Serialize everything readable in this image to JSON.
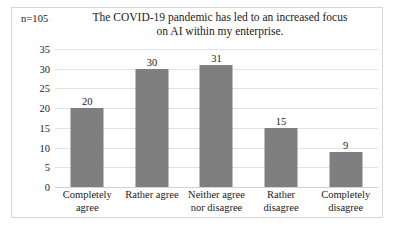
{
  "figure": {
    "sample_size_label": "n=105",
    "border_color": "#d6d6d6",
    "background": "#ffffff"
  },
  "chart_data": {
    "type": "bar",
    "title": "The COVID-19 pandemic has led to an increased focus on AI within my enterprise.",
    "title_lines": [
      "The COVID-19 pandemic has led to an increased focus",
      "on AI within my enterprise."
    ],
    "categories": [
      "Completely agree",
      "Rather agree",
      "Neither agree nor disagree",
      "Rather disagree",
      "Completely disagree"
    ],
    "category_lines": [
      [
        "Completely",
        "agree"
      ],
      [
        "Rather agree"
      ],
      [
        "Neither agree",
        "nor disagree"
      ],
      [
        "Rather disagree"
      ],
      [
        "Completely",
        "disagree"
      ]
    ],
    "values": [
      20,
      30,
      31,
      15,
      9
    ],
    "value_labels": [
      "20",
      "30",
      "31",
      "15",
      "9"
    ],
    "xlabel": "",
    "ylabel": "",
    "ylim": [
      0,
      35
    ],
    "yticks": [
      0,
      5,
      10,
      15,
      20,
      25,
      30,
      35
    ],
    "ytick_labels": [
      "0",
      "5",
      "10",
      "15",
      "20",
      "25",
      "30",
      "35"
    ],
    "grid": true,
    "legend": false,
    "bar_color": "#7f7f7f",
    "gridline_color": "#e3e3e3",
    "annotations": [
      "n=105"
    ]
  }
}
